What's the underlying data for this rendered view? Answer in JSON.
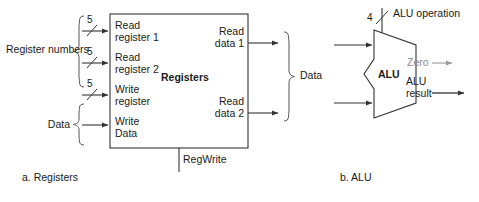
{
  "diagram": {
    "colors": {
      "line": "#333333",
      "gray_line": "#9a9a9a",
      "text": "#1a1a1a",
      "gray_text": "#8d8d8d",
      "background": "#ffffff"
    }
  },
  "registers": {
    "caption": "a. Registers",
    "block_label": "Registers",
    "group_label_inputs": "Register numbers",
    "group_label_data_in": "Data",
    "group_label_data_out": "Data",
    "control_label": "RegWrite",
    "inputs": [
      {
        "label_line1": "Read",
        "label_line2": "register 1",
        "width": "5"
      },
      {
        "label_line1": "Read",
        "label_line2": "register 2",
        "width": "5"
      },
      {
        "label_line1": "Write",
        "label_line2": "register",
        "width": "5"
      },
      {
        "label_line1": "Write",
        "label_line2": "Data",
        "width": ""
      }
    ],
    "outputs": [
      {
        "label_line1": "Read",
        "label_line2": "data 1"
      },
      {
        "label_line1": "Read",
        "label_line2": "data 2"
      }
    ]
  },
  "alu": {
    "caption": "b. ALU",
    "block_label": "ALU",
    "control_label": "ALU operation",
    "control_width": "4",
    "output_zero": "Zero",
    "output_result_line1": "ALU",
    "output_result_line2": "result"
  }
}
